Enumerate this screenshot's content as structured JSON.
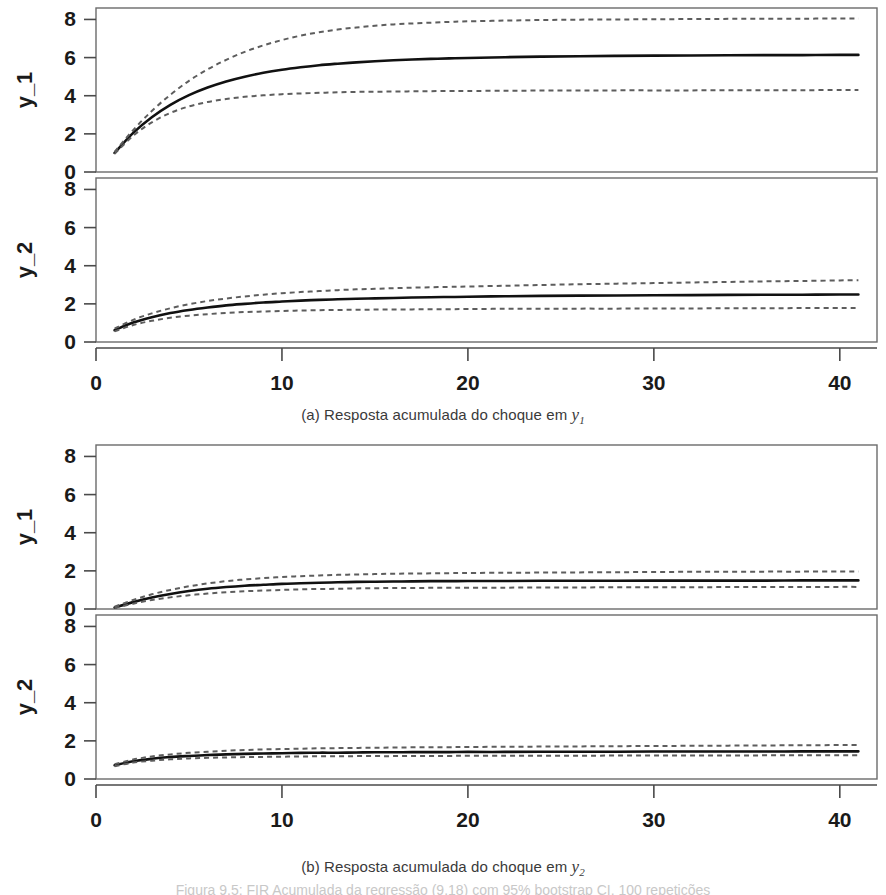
{
  "figure": {
    "note": "Figura 9.5: FIR Acumulada da regressão (9.18) com 95% bootstrap CI, 100 repetições",
    "panel_a_caption_prefix": "(a) Resposta acumulada do choque em ",
    "panel_a_caption_var": "y",
    "panel_a_caption_sub": "1",
    "panel_b_caption_prefix": "(b) Resposta acumulada do choque em ",
    "panel_b_caption_var": "y",
    "panel_b_caption_sub": "2"
  },
  "axis_labels": {
    "y1": "y_1",
    "y2": "y_2"
  },
  "colors": {
    "solid": "#111111",
    "dashed": "#5d5d5d",
    "frame": "#6b6b6b",
    "text": "#1a1a1a",
    "background": "#ffffff"
  },
  "chart_data": [
    {
      "type": "line",
      "id": "a-y1",
      "title": "(a) Resposta acumulada do choque em y_1",
      "subtitle": "Accumulated impulse response of y_1 to a shock in y_1",
      "xlabel": "",
      "ylabel": "y_1",
      "xlim": [
        0,
        42
      ],
      "ylim": [
        0,
        8.6
      ],
      "xticks": [
        0,
        10,
        20,
        30,
        40
      ],
      "yticks": [
        0,
        2,
        4,
        6,
        8
      ],
      "grid": false,
      "legend": "none",
      "x": [
        1,
        2,
        3,
        4,
        5,
        6,
        7,
        8,
        9,
        10,
        11,
        12,
        13,
        14,
        15,
        16,
        17,
        18,
        19,
        20,
        22,
        24,
        26,
        28,
        30,
        32,
        34,
        36,
        38,
        40,
        41
      ],
      "series": [
        {
          "name": "Accumulated IRF (point estimate)",
          "style": "solid",
          "values": [
            1.0,
            2.05,
            2.87,
            3.52,
            4.03,
            4.43,
            4.75,
            5.0,
            5.2,
            5.36,
            5.49,
            5.6,
            5.68,
            5.75,
            5.81,
            5.86,
            5.9,
            5.93,
            5.96,
            5.98,
            6.02,
            6.05,
            6.07,
            6.09,
            6.1,
            6.11,
            6.12,
            6.13,
            6.13,
            6.14,
            6.14
          ]
        },
        {
          "name": "95% bootstrap CI upper",
          "style": "dashed",
          "values": [
            1.05,
            2.2,
            3.2,
            4.05,
            4.78,
            5.38,
            5.88,
            6.3,
            6.64,
            6.92,
            7.15,
            7.33,
            7.47,
            7.58,
            7.67,
            7.74,
            7.79,
            7.83,
            7.87,
            7.9,
            7.94,
            7.97,
            7.99,
            8.0,
            8.01,
            8.02,
            8.03,
            8.04,
            8.04,
            8.05,
            8.05
          ]
        },
        {
          "name": "95% bootstrap CI lower",
          "style": "dashed",
          "values": [
            0.95,
            1.9,
            2.6,
            3.1,
            3.44,
            3.67,
            3.83,
            3.94,
            4.02,
            4.08,
            4.12,
            4.15,
            4.18,
            4.2,
            4.21,
            4.22,
            4.23,
            4.24,
            4.25,
            4.25,
            4.26,
            4.27,
            4.27,
            4.28,
            4.28,
            4.28,
            4.29,
            4.29,
            4.29,
            4.3,
            4.3
          ]
        }
      ]
    },
    {
      "type": "line",
      "id": "a-y2",
      "title": "(a) Resposta acumulada do choque em y_1",
      "subtitle": "Accumulated impulse response of y_2 to a shock in y_1",
      "xlabel": "",
      "ylabel": "y_2",
      "xlim": [
        0,
        42
      ],
      "ylim": [
        0,
        8.6
      ],
      "xticks": [
        0,
        10,
        20,
        30,
        40
      ],
      "yticks": [
        0,
        2,
        4,
        6,
        8
      ],
      "grid": false,
      "legend": "none",
      "x": [
        1,
        2,
        3,
        4,
        5,
        6,
        7,
        8,
        9,
        10,
        11,
        12,
        13,
        14,
        15,
        16,
        17,
        18,
        19,
        20,
        22,
        24,
        26,
        28,
        30,
        32,
        34,
        36,
        38,
        40,
        41
      ],
      "series": [
        {
          "name": "Accumulated IRF (point estimate)",
          "style": "solid",
          "values": [
            0.62,
            1.02,
            1.3,
            1.52,
            1.68,
            1.81,
            1.92,
            2.0,
            2.07,
            2.12,
            2.17,
            2.21,
            2.24,
            2.27,
            2.29,
            2.31,
            2.33,
            2.35,
            2.36,
            2.37,
            2.4,
            2.42,
            2.43,
            2.44,
            2.45,
            2.46,
            2.47,
            2.48,
            2.48,
            2.49,
            2.49
          ]
        },
        {
          "name": "95% bootstrap CI upper",
          "style": "dashed",
          "values": [
            0.7,
            1.16,
            1.5,
            1.77,
            1.98,
            2.15,
            2.28,
            2.39,
            2.48,
            2.56,
            2.62,
            2.67,
            2.72,
            2.76,
            2.79,
            2.82,
            2.85,
            2.87,
            2.89,
            2.91,
            2.95,
            2.99,
            3.03,
            3.06,
            3.09,
            3.12,
            3.15,
            3.18,
            3.2,
            3.23,
            3.24
          ]
        },
        {
          "name": "95% bootstrap CI lower",
          "style": "dashed",
          "values": [
            0.56,
            0.89,
            1.11,
            1.27,
            1.38,
            1.46,
            1.52,
            1.57,
            1.6,
            1.63,
            1.65,
            1.67,
            1.68,
            1.69,
            1.7,
            1.71,
            1.71,
            1.72,
            1.72,
            1.73,
            1.74,
            1.74,
            1.75,
            1.75,
            1.76,
            1.76,
            1.77,
            1.77,
            1.78,
            1.78,
            1.78
          ]
        }
      ]
    },
    {
      "type": "line",
      "id": "b-y1",
      "title": "(b) Resposta acumulada do choque em y_2",
      "subtitle": "Accumulated impulse response of y_1 to a shock in y_2",
      "xlabel": "",
      "ylabel": "y_1",
      "xlim": [
        0,
        42
      ],
      "ylim": [
        0,
        8.6
      ],
      "xticks": [
        0,
        10,
        20,
        30,
        40
      ],
      "yticks": [
        0,
        2,
        4,
        6,
        8
      ],
      "grid": false,
      "legend": "none",
      "x": [
        1,
        2,
        3,
        4,
        5,
        6,
        7,
        8,
        9,
        10,
        11,
        12,
        13,
        14,
        15,
        16,
        17,
        18,
        19,
        20,
        22,
        24,
        26,
        28,
        30,
        32,
        34,
        36,
        38,
        40,
        41
      ],
      "series": [
        {
          "name": "Accumulated IRF (point estimate)",
          "style": "solid",
          "values": [
            0.08,
            0.36,
            0.6,
            0.79,
            0.94,
            1.06,
            1.15,
            1.22,
            1.27,
            1.32,
            1.35,
            1.38,
            1.4,
            1.42,
            1.43,
            1.44,
            1.45,
            1.46,
            1.46,
            1.47,
            1.47,
            1.48,
            1.48,
            1.48,
            1.49,
            1.49,
            1.49,
            1.49,
            1.5,
            1.5,
            1.5
          ]
        },
        {
          "name": "95% bootstrap CI upper",
          "style": "dashed",
          "values": [
            0.12,
            0.47,
            0.77,
            1.0,
            1.19,
            1.34,
            1.46,
            1.55,
            1.62,
            1.68,
            1.72,
            1.76,
            1.79,
            1.81,
            1.83,
            1.85,
            1.86,
            1.87,
            1.88,
            1.89,
            1.9,
            1.91,
            1.92,
            1.93,
            1.94,
            1.95,
            1.95,
            1.96,
            1.96,
            1.97,
            1.97
          ]
        },
        {
          "name": "95% bootstrap CI lower",
          "style": "dashed",
          "values": [
            0.05,
            0.28,
            0.47,
            0.61,
            0.72,
            0.81,
            0.88,
            0.93,
            0.97,
            1.0,
            1.03,
            1.05,
            1.06,
            1.08,
            1.09,
            1.1,
            1.1,
            1.11,
            1.11,
            1.12,
            1.12,
            1.13,
            1.13,
            1.14,
            1.14,
            1.14,
            1.15,
            1.15,
            1.15,
            1.16,
            1.16
          ]
        }
      ]
    },
    {
      "type": "line",
      "id": "b-y2",
      "title": "(b) Resposta acumulada do choque em y_2",
      "subtitle": "Accumulated impulse response of y_2 to a shock in y_2",
      "xlabel": "",
      "ylabel": "y_2",
      "xlim": [
        0,
        42
      ],
      "ylim": [
        0,
        8.6
      ],
      "xticks": [
        0,
        10,
        20,
        30,
        40
      ],
      "yticks": [
        0,
        2,
        4,
        6,
        8
      ],
      "grid": false,
      "legend": "none",
      "x": [
        1,
        2,
        3,
        4,
        5,
        6,
        7,
        8,
        9,
        10,
        11,
        12,
        13,
        14,
        15,
        16,
        17,
        18,
        19,
        20,
        22,
        24,
        26,
        28,
        30,
        32,
        34,
        36,
        38,
        40,
        41
      ],
      "series": [
        {
          "name": "Accumulated IRF (point estimate)",
          "style": "solid",
          "values": [
            0.72,
            0.93,
            1.06,
            1.15,
            1.21,
            1.26,
            1.29,
            1.32,
            1.34,
            1.35,
            1.37,
            1.38,
            1.38,
            1.39,
            1.4,
            1.4,
            1.41,
            1.41,
            1.41,
            1.42,
            1.42,
            1.43,
            1.43,
            1.43,
            1.44,
            1.44,
            1.44,
            1.44,
            1.45,
            1.45,
            1.45
          ]
        },
        {
          "name": "95% bootstrap CI upper",
          "style": "dashed",
          "values": [
            0.78,
            1.02,
            1.18,
            1.29,
            1.37,
            1.43,
            1.48,
            1.52,
            1.55,
            1.57,
            1.59,
            1.61,
            1.62,
            1.63,
            1.64,
            1.65,
            1.66,
            1.67,
            1.67,
            1.68,
            1.69,
            1.7,
            1.71,
            1.72,
            1.73,
            1.74,
            1.75,
            1.76,
            1.77,
            1.78,
            1.78
          ]
        },
        {
          "name": "95% bootstrap CI lower",
          "style": "dashed",
          "values": [
            0.67,
            0.86,
            0.96,
            1.03,
            1.08,
            1.11,
            1.13,
            1.15,
            1.16,
            1.17,
            1.18,
            1.19,
            1.19,
            1.2,
            1.2,
            1.2,
            1.21,
            1.21,
            1.21,
            1.22,
            1.22,
            1.22,
            1.22,
            1.23,
            1.23,
            1.23,
            1.23,
            1.24,
            1.24,
            1.24,
            1.24
          ]
        }
      ]
    }
  ]
}
